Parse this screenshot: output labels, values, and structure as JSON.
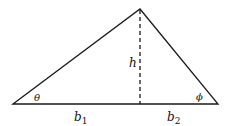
{
  "diagram": {
    "type": "triangle",
    "vertices": {
      "left": [
        13,
        104
      ],
      "apex": [
        140,
        9
      ],
      "right": [
        218,
        104
      ]
    },
    "altitude_foot": [
      140,
      104
    ],
    "labels": {
      "theta": "θ",
      "phi": "ϕ",
      "h": "h",
      "b1": "b",
      "b1_sub": "1",
      "b2": "b",
      "b2_sub": "2"
    },
    "colors": {
      "stroke": "#1a1a1a",
      "background": "#ffffff"
    }
  }
}
